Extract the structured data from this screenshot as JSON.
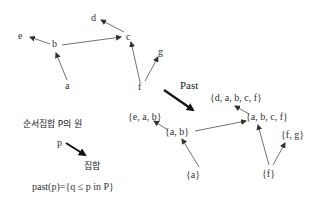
{
  "poset": {
    "nodes": {
      "a": "a",
      "b": "b",
      "c": "c",
      "d": "d",
      "e": "e",
      "f": "f",
      "g": "g"
    }
  },
  "transform": {
    "label": "Past"
  },
  "past_sets": {
    "dabcf": "{d, a, b, c, f}",
    "abcf": "{a, b, c, f}",
    "eab": "{e, a, b}",
    "ab": "{a, b}",
    "fg": "{f, g}",
    "a": "{a}",
    "f": "{f}"
  },
  "legend": {
    "element_label": "순서집합 P의 원",
    "p_label": "p",
    "set_label": "집합",
    "formula": "past(p)={q ≤ p in P}"
  },
  "colors": {
    "line": "#333333",
    "text": "#333333"
  }
}
